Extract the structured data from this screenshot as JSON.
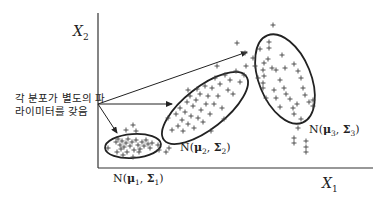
{
  "diagram": {
    "annotation": {
      "line1": "각 분포가 별도의 파",
      "line2": "라이미터를 갖음"
    },
    "axes": {
      "x_label": "X",
      "x_subscript": "1",
      "y_label": "X",
      "y_subscript": "2"
    },
    "distributions": [
      {
        "prefix": "N(",
        "mu": "μ",
        "index": "1",
        "sep": ", ",
        "sigma": "Σ",
        "suffix": ")"
      },
      {
        "prefix": "N(",
        "mu": "μ",
        "index": "2",
        "sep": ", ",
        "sigma": "Σ",
        "suffix": ")"
      },
      {
        "prefix": "N(",
        "mu": "μ",
        "index": "3",
        "sep": ", ",
        "sigma": "Σ",
        "suffix": ")"
      }
    ],
    "colors": {
      "stroke": "#222222",
      "points": "#444444",
      "background": "#ffffff"
    }
  }
}
